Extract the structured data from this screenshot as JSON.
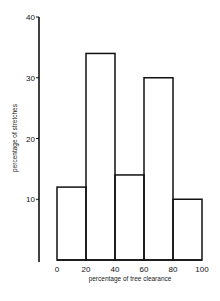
{
  "chart_data": {
    "type": "bar",
    "title": "",
    "xlabel": "percentage of tree clearance",
    "ylabel": "percentage of stretches",
    "categories": [
      "0-20",
      "20-40",
      "40-60",
      "60-80",
      "80-100"
    ],
    "bin_edges": [
      0,
      20,
      40,
      60,
      80,
      100
    ],
    "values": [
      12,
      34,
      14,
      30,
      10
    ],
    "xticks": [
      "0",
      "20",
      "40",
      "60",
      "80",
      "100"
    ],
    "yticks": [
      "10",
      "20",
      "30",
      "40"
    ],
    "xlim": [
      0,
      100
    ],
    "ylim": [
      0,
      40
    ],
    "grid": false,
    "legend": null,
    "style": "histogram outline, unfilled bars"
  },
  "colors": {
    "line": "#111111",
    "background": "#ffffff"
  }
}
